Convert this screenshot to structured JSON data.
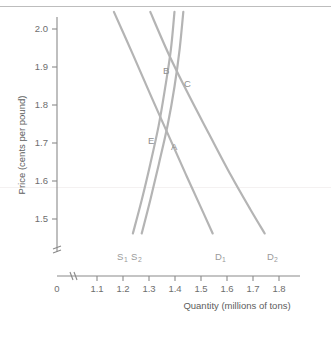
{
  "chart_data": {
    "type": "line",
    "title": "",
    "xlabel": "Quantity (millions of tons)",
    "ylabel": "Price (cents per pound)",
    "xlim": [
      1.05,
      1.83
    ],
    "ylim": [
      1.44,
      2.04
    ],
    "grid": false,
    "legend_position": "inline-curve-end-labels",
    "x_ticks": [
      "0",
      "1.1",
      "1.2",
      "1.3",
      "1.4",
      "1.5",
      "1.6",
      "1.7",
      "1.8"
    ],
    "x_tick_values": [
      0,
      1.1,
      1.2,
      1.3,
      1.4,
      1.5,
      1.6,
      1.7,
      1.8
    ],
    "x_axis_break": true,
    "y_ticks": [
      "1.5",
      "1.6",
      "1.7",
      "1.8",
      "1.9",
      "2.0"
    ],
    "y_tick_values": [
      1.5,
      1.6,
      1.7,
      1.8,
      1.9,
      2.0
    ],
    "y_axis_break": true,
    "series": [
      {
        "name": "D1",
        "label": "D",
        "subscript": "1",
        "kind": "demand",
        "points": [
          [
            1.165,
            2.045
          ],
          [
            1.24,
            1.93
          ],
          [
            1.31,
            1.82
          ],
          [
            1.375,
            1.72
          ],
          [
            1.44,
            1.62
          ],
          [
            1.5,
            1.53
          ],
          [
            1.545,
            1.462
          ]
        ]
      },
      {
        "name": "D2",
        "label": "D",
        "subscript": "2",
        "kind": "demand",
        "points": [
          [
            1.305,
            2.045
          ],
          [
            1.375,
            1.935
          ],
          [
            1.45,
            1.83
          ],
          [
            1.53,
            1.725
          ],
          [
            1.615,
            1.615
          ],
          [
            1.69,
            1.525
          ],
          [
            1.745,
            1.462
          ]
        ]
      },
      {
        "name": "S1",
        "label": "S",
        "subscript": "1",
        "kind": "supply",
        "points": [
          [
            1.238,
            1.462
          ],
          [
            1.272,
            1.55
          ],
          [
            1.305,
            1.645
          ],
          [
            1.337,
            1.745
          ],
          [
            1.362,
            1.845
          ],
          [
            1.384,
            1.945
          ],
          [
            1.398,
            2.045
          ]
        ]
      },
      {
        "name": "S2",
        "label": "S",
        "subscript": "2",
        "kind": "supply",
        "points": [
          [
            1.272,
            1.462
          ],
          [
            1.305,
            1.55
          ],
          [
            1.338,
            1.645
          ],
          [
            1.372,
            1.748
          ],
          [
            1.398,
            1.848
          ],
          [
            1.418,
            1.948
          ],
          [
            1.432,
            2.045
          ]
        ]
      }
    ],
    "annotations": [
      {
        "label": "A",
        "x": 1.352,
        "y": 1.7,
        "note": "intersection of D1 and S2"
      },
      {
        "label": "B",
        "x": 1.372,
        "y": 1.895,
        "note": "intersection of D2 and S1"
      },
      {
        "label": "C",
        "x": 1.405,
        "y": 1.862,
        "note": "intersection of D2 and S2"
      },
      {
        "label": "E",
        "x": 1.325,
        "y": 1.728,
        "note": "intersection of D1 and S1"
      }
    ],
    "curve_end_labels": [
      {
        "series": "S1",
        "label": "S",
        "subscript": "1",
        "x": 1.229,
        "y": 1.437
      },
      {
        "series": "S2",
        "label": "S",
        "subscript": "2",
        "x": 1.272,
        "y": 1.437
      },
      {
        "series": "D1",
        "label": "D",
        "subscript": "1",
        "x": 1.528,
        "y": 1.437
      },
      {
        "series": "D2",
        "label": "D",
        "subscript": "2",
        "x": 1.728,
        "y": 1.437
      }
    ]
  },
  "colors": {
    "curve": "#b4b4b4",
    "axis": "#8a8a8a",
    "tick_text": "#6e6e6e",
    "axis_title": "#5d5d5d",
    "label_text": "#9a9a9a",
    "background": "#ffffff"
  }
}
